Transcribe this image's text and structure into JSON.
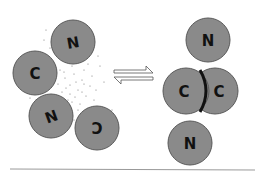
{
  "diagram": {
    "left_state": {
      "description": "dissociated monomers with surrounding solvent",
      "subunits": [
        {
          "label": "N",
          "cx": 73,
          "cy": 42
        },
        {
          "label": "C",
          "cx": 35,
          "cy": 73
        },
        {
          "label": "N",
          "cx": 51,
          "cy": 116
        },
        {
          "label": "C",
          "cx": 97,
          "cy": 128
        }
      ]
    },
    "equilibrium_arrows": {
      "symbol": "⇌"
    },
    "right_state": {
      "description": "dimer with C–C interface",
      "subunits": [
        {
          "label": "N",
          "cx": 208,
          "cy": 40
        },
        {
          "label": "C",
          "cx": 186,
          "cy": 91
        },
        {
          "label": "C",
          "cx": 215,
          "cy": 91
        },
        {
          "label": "N",
          "cx": 190,
          "cy": 143
        }
      ]
    },
    "colors": {
      "subunit_fill": "#8a8a8a",
      "subunit_stroke": "#5a5a5a",
      "label": "#111111",
      "interface": "#111111",
      "dots": "#777777",
      "baseline": "#999999"
    }
  }
}
